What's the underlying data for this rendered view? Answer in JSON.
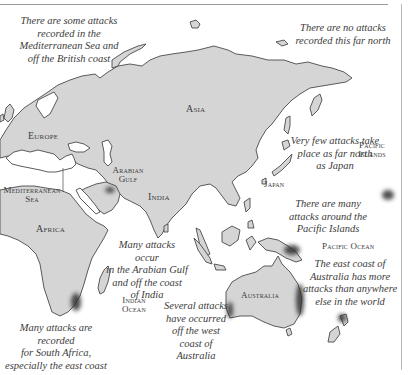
{
  "map": {
    "title": "Shark attack distribution (Eastern Hemisphere)",
    "colors": {
      "land": "#d5d5d5",
      "coast": "#4a4a4a",
      "water": "#ffffff",
      "text": "#3c3c3c",
      "hotspot": "#2e2e2e"
    },
    "labels": {
      "asia": "Asia",
      "europe": "Europe",
      "africa": "Africa",
      "india": "India",
      "japan": "Japan",
      "australia": "Australia",
      "arabian_gulf_1": "Arabian",
      "arabian_gulf_2": "Gulf",
      "mediterranean_1": "Mediterranean",
      "mediterranean_2": "Sea",
      "indian_ocean_1": "Indian",
      "indian_ocean_2": "Ocean",
      "pacific_islands_1": "Pacific",
      "pacific_islands_2": "Islands",
      "pacific_ocean": "Pacific Ocean"
    },
    "annotations": {
      "mediterranean": [
        "There are some attacks",
        "recorded in the",
        "Mediterranean Sea and",
        "off the British coast"
      ],
      "far_north": [
        "There are no attacks",
        "recorded this far north"
      ],
      "japan": [
        "Very few attacks take",
        "place as far north",
        "as Japan"
      ],
      "pacific_islands": [
        "There are many",
        "attacks around the",
        "Pacific Islands"
      ],
      "arabian_gulf": [
        "Many attacks occur",
        "in the Arabian Gulf",
        "and off the coast",
        "of India"
      ],
      "east_australia": [
        "The east coast of",
        "Australia has more",
        "attacks than anywhere",
        "else in the world"
      ],
      "west_australia": [
        "Several attacks",
        "have occurred",
        "off the west",
        "coast of",
        "Australia"
      ],
      "south_africa": [
        "Many attacks are recorded",
        "for South Africa,",
        "especially the east coast"
      ]
    }
  }
}
